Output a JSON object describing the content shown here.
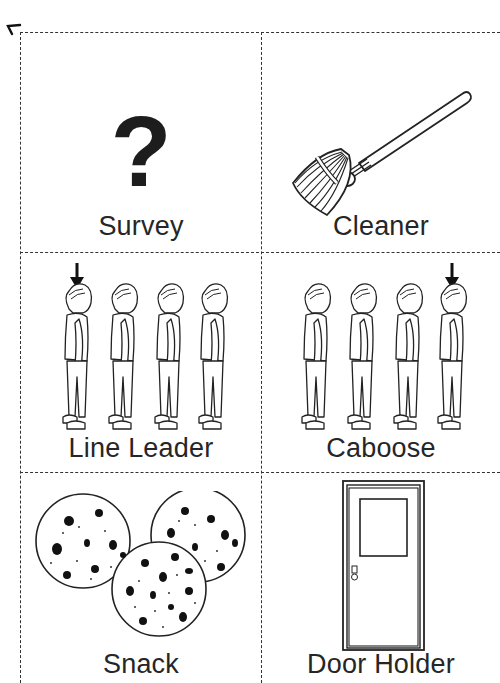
{
  "document": {
    "type": "classroom job cards",
    "cards": [
      {
        "label": "Survey",
        "icon": "question-mark-icon",
        "glyph": "?"
      },
      {
        "label": "Cleaner",
        "icon": "broom-icon"
      },
      {
        "label": "Line Leader",
        "icon": "line-of-children-first-marked-icon"
      },
      {
        "label": "Caboose",
        "icon": "line-of-children-last-marked-icon"
      },
      {
        "label": "Snack",
        "icon": "cookies-icon"
      },
      {
        "label": "Door Holder",
        "icon": "door-icon"
      }
    ]
  },
  "colors": {
    "ink": "#1a1a1a",
    "background": "#ffffff",
    "cut_line": "#333333"
  }
}
